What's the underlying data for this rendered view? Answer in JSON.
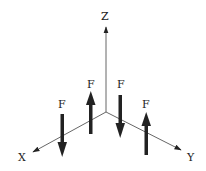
{
  "diagram": {
    "type": "3d-axes-force-couples",
    "origin": [
      106,
      112
    ],
    "colors": {
      "axis": "#555555",
      "force": "#222222",
      "label": "#222222",
      "background": "#ffffff"
    },
    "axes": [
      {
        "name": "z-axis",
        "label": "Z",
        "end": [
          106,
          26
        ],
        "label_pos": [
          100,
          50
        ]
      },
      {
        "name": "x-axis",
        "label": "X",
        "end": [
          32,
          152
        ],
        "label_pos": [
          18,
          162
        ]
      },
      {
        "name": "y-axis",
        "label": "Y",
        "end": [
          182,
          150
        ],
        "label_pos": [
          187,
          162
        ]
      }
    ],
    "forces": [
      {
        "name": "force-1",
        "label": "F",
        "direction": "down",
        "x": 62,
        "y_start": 114,
        "y_end": 156,
        "label_pos": [
          58,
          108
        ]
      },
      {
        "name": "force-2",
        "label": "F",
        "direction": "up",
        "x": 91,
        "y_start": 134,
        "y_end": 91,
        "label_pos": [
          87,
          88
        ]
      },
      {
        "name": "force-3",
        "label": "F",
        "direction": "down",
        "x": 120,
        "y_start": 95,
        "y_end": 137,
        "label_pos": [
          117,
          88
        ]
      },
      {
        "name": "force-4",
        "label": "F",
        "direction": "up",
        "x": 146,
        "y_start": 154,
        "y_end": 112,
        "label_pos": [
          142,
          108
        ]
      }
    ]
  }
}
